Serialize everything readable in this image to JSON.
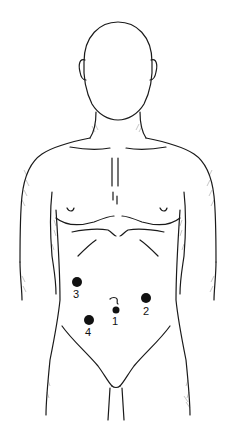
{
  "figure": {
    "markers": [
      {
        "id": "1",
        "label": "1",
        "x": 116,
        "y": 310,
        "r": 3.5,
        "label_x": 115,
        "label_y": 316
      },
      {
        "id": "2",
        "label": "2",
        "x": 146,
        "y": 298,
        "r": 5,
        "label_x": 146,
        "label_y": 306
      },
      {
        "id": "3",
        "label": "3",
        "x": 77,
        "y": 282,
        "r": 5,
        "label_x": 76,
        "label_y": 289
      },
      {
        "id": "4",
        "label": "4",
        "x": 89,
        "y": 320,
        "r": 5,
        "label_x": 88,
        "label_y": 327
      }
    ],
    "marker_color": "#111111",
    "line_color": "#1a1a1a"
  }
}
